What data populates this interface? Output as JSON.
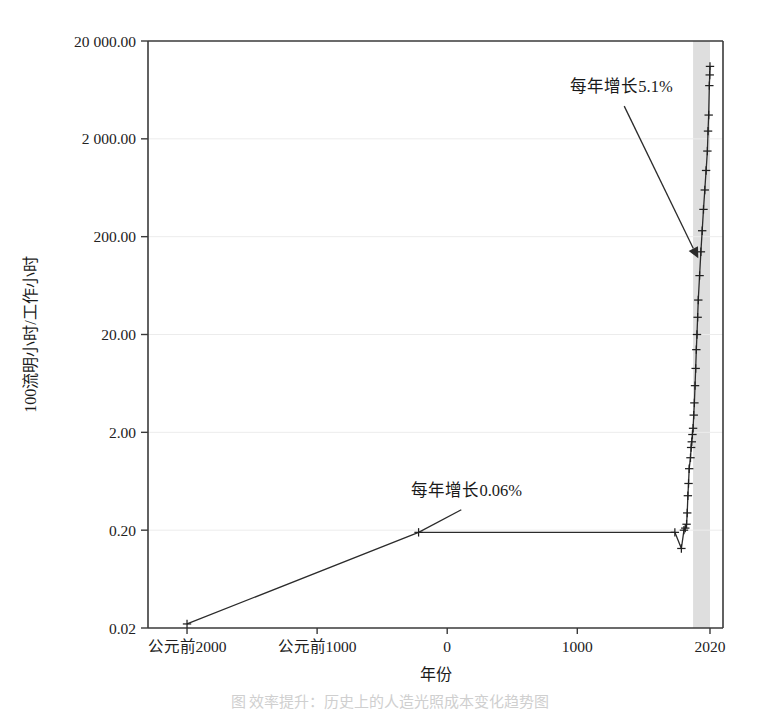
{
  "figure": {
    "caption": "图 效率提升：历史上的人造光照成本变化趋势图"
  },
  "chart_data": {
    "type": "line",
    "title": "",
    "xlabel": "年份",
    "ylabel": "100流明小时/工作小时",
    "xlim": [
      -2300,
      2120
    ],
    "ylim": [
      0.02,
      20000
    ],
    "yscale": "log",
    "grid": true,
    "legend_position": "none",
    "x_ticks": [
      {
        "value": -2000,
        "label": "公元前2000"
      },
      {
        "value": -1000,
        "label": "公元前1000"
      },
      {
        "value": 0,
        "label": "0"
      },
      {
        "value": 1000,
        "label": "1000"
      },
      {
        "value": 2020,
        "label": "2020"
      }
    ],
    "y_ticks": [
      {
        "value": 20000,
        "label": "20 000.00"
      },
      {
        "value": 2000,
        "label": "2 000.00"
      },
      {
        "value": 200,
        "label": "200.00"
      },
      {
        "value": 20,
        "label": "20.00"
      },
      {
        "value": 2,
        "label": "2.00"
      },
      {
        "value": 0.2,
        "label": "0.20"
      },
      {
        "value": 0.02,
        "label": "0.02"
      }
    ],
    "shaded_region": {
      "x_start": 1890,
      "x_end": 2020,
      "color": "#dedede",
      "label": ""
    },
    "series": [
      {
        "name": "人造光效率",
        "marker": "plus",
        "x": [
          -2000,
          -220,
          1750,
          1800,
          1820,
          1830,
          1840,
          1845,
          1850,
          1855,
          1860,
          1870,
          1875,
          1880,
          1885,
          1890,
          1895,
          1900,
          1905,
          1910,
          1915,
          1920,
          1925,
          1930,
          1940,
          1950,
          1960,
          1970,
          1980,
          1990,
          2000,
          2005,
          2010,
          2015,
          2018,
          2020
        ],
        "y": [
          0.022,
          0.19,
          0.19,
          0.13,
          0.2,
          0.21,
          0.23,
          0.3,
          0.45,
          0.6,
          0.85,
          1.1,
          1.4,
          1.6,
          1.9,
          2.2,
          3.0,
          4.0,
          6.0,
          9.0,
          14,
          20,
          30,
          45,
          80,
          140,
          230,
          380,
          600,
          950,
          1500,
          2400,
          3500,
          7000,
          9000,
          11000
        ]
      }
    ],
    "annotations": [
      {
        "text": "每年增长5.1%",
        "text_x": 1340,
        "text_y": 6000,
        "arrow_to_x": 1930,
        "arrow_to_y": 120,
        "has_arrowhead": true
      },
      {
        "text": "每年增长0.06%",
        "text_x": 150,
        "text_y": 0.45,
        "arrow_to_x": -220,
        "arrow_to_y": 0.19,
        "has_arrowhead": false
      }
    ]
  },
  "colors": {
    "grid": "#ececec",
    "frame": "#3a3a3a",
    "line": "#2b2b2b",
    "band": "#dedede",
    "text": "#1a1a1a"
  }
}
